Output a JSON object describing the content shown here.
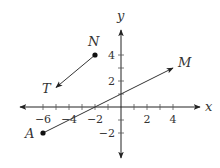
{
  "diagram": {
    "type": "coordinate-plane",
    "origin_px": [
      121,
      107
    ],
    "unit_px": 13,
    "axes": {
      "x_label": "x",
      "y_label": "y",
      "x_ticks": [
        -6,
        -5,
        -4,
        -3,
        -2,
        -1,
        1,
        2,
        3,
        4
      ],
      "y_ticks": [
        -2,
        -1,
        1,
        2,
        3,
        4
      ],
      "x_tick_labels": [
        {
          "value": -6,
          "text": "−6"
        },
        {
          "value": -4,
          "text": "−4"
        },
        {
          "value": -2,
          "text": "−2"
        },
        {
          "value": 2,
          "text": "2"
        },
        {
          "value": 4,
          "text": "4"
        }
      ],
      "y_tick_labels": [
        {
          "value": 4,
          "text": "4"
        },
        {
          "value": 2,
          "text": "2"
        },
        {
          "value": -2,
          "text": "−2"
        }
      ]
    },
    "points": {
      "N": {
        "label": "N",
        "coords": [
          -2,
          4
        ]
      },
      "T": {
        "label": "T",
        "coords": [
          -5,
          1.5
        ]
      },
      "A": {
        "label": "A",
        "coords": [
          -6,
          -2
        ]
      },
      "M": {
        "label": "M",
        "coords": [
          4,
          3
        ]
      }
    },
    "rays": [
      {
        "name": "ray-NT",
        "from": "N",
        "to": "T",
        "start_dot": true,
        "end_arrow": true
      },
      {
        "name": "ray-AM",
        "from": "A",
        "to": "M",
        "start_dot": true,
        "end_arrow": true
      }
    ],
    "colors": {
      "stroke": "#333333",
      "axis": "#222222",
      "text": "#333333"
    }
  }
}
